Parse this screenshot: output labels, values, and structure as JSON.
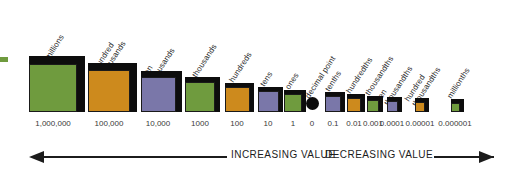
{
  "chart_data": {
    "type": "bar",
    "xlabel": "",
    "ylabel": "",
    "grid": false,
    "legend": "none",
    "orientation": "horizontal-row-of-3d-cubes",
    "note": "Cube edge size is proportional to the magnitude of each place value; colors cycle green/orange/purple.",
    "categories": [
      "millions",
      "hundred thousands",
      "ten thousands",
      "thousands",
      "hundreds",
      "tens",
      "ones",
      "decimal point",
      "tenths",
      "hundredths",
      "thousandths",
      "ten thousandths",
      "hundred thousandths",
      "millionths"
    ],
    "values": [
      "1,000,000",
      "100,000",
      "10,000",
      "1000",
      "100",
      "10",
      "1",
      "0",
      "0.1",
      "0.01",
      "0.001",
      "0.0001",
      "0.00001",
      "0.000001"
    ],
    "colors": [
      "#6f9b3e",
      "#cd8a1d",
      "#7a77a9",
      "#6f9b3e",
      "#cd8a1d",
      "#7a77a9",
      "#6f9b3e",
      "#0b0b0b",
      "#7a77a9",
      "#cd8a1d",
      "#6f9b3e",
      "#7a77a9",
      "#cd8a1d",
      "#6f9b3e"
    ],
    "cube_sizes_px": [
      48,
      42,
      35,
      30,
      25,
      21,
      18,
      13,
      16,
      14,
      12,
      11,
      10,
      9
    ]
  },
  "labels": [
    {
      "line1": "millions",
      "line2": ""
    },
    {
      "line1": "hundred",
      "line2": "thousands"
    },
    {
      "line1": "ten",
      "line2": "thousands"
    },
    {
      "line1": "thousands",
      "line2": ""
    },
    {
      "line1": "hundreds",
      "line2": ""
    },
    {
      "line1": "tens",
      "line2": ""
    },
    {
      "line1": "ones",
      "line2": ""
    },
    {
      "line1": "decimal point",
      "line2": ""
    },
    {
      "line1": "tenths",
      "line2": ""
    },
    {
      "line1": "hundredths",
      "line2": ""
    },
    {
      "line1": "thousandths",
      "line2": ""
    },
    {
      "line1": "ten",
      "line2": "thousandths"
    },
    {
      "line1": "hundred",
      "line2": "thousandths"
    },
    {
      "line1": "millionths",
      "line2": ""
    }
  ],
  "values": [
    "1,000,000",
    "100,000",
    "10,000",
    "1000",
    "100",
    "10",
    "1",
    "0",
    "0.1",
    "0.01",
    "0.001",
    "0.0001",
    "0.00001",
    "0.000001"
  ],
  "footer": {
    "increasing_caption": "INCREASING VALUE",
    "decreasing_caption": "DECREASING VALUE"
  },
  "palette": {
    "green": "#6f9b3e",
    "orange": "#cd8a1d",
    "purple": "#7a77a9",
    "black": "#0b0b0b",
    "outline": "#1a1a1a",
    "text": "#2b2b2b",
    "background": "#ffffff"
  }
}
